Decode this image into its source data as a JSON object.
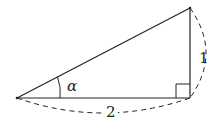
{
  "diagram": {
    "type": "right-triangle",
    "colors": {
      "stroke": "#222222",
      "background": "#ffffff"
    },
    "vertices": {
      "left": [
        17,
        98
      ],
      "right_angle": [
        190,
        98
      ],
      "top": [
        190,
        8
      ]
    },
    "labels": {
      "angle": "α",
      "vertical_side": "1",
      "horizontal_side": "2"
    },
    "annotations": {
      "right_angle_marker": true,
      "dashed_dimension_arcs": [
        "horizontal_side",
        "vertical_side"
      ]
    }
  }
}
